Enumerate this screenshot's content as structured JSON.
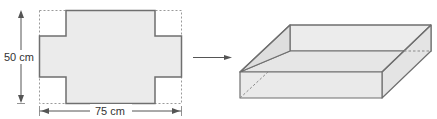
{
  "diagram": {
    "net": {
      "height_label": "50 cm",
      "width_label": "75 cm"
    },
    "colors": {
      "fill": "#ebebeb",
      "stroke": "#6f6f6f",
      "dashed": "#9a9a9a",
      "text": "#333333"
    }
  }
}
